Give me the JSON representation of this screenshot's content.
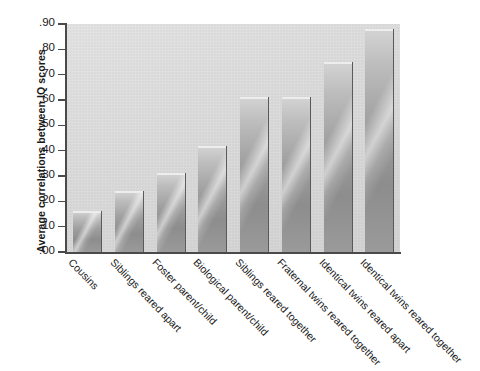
{
  "chart_data": {
    "type": "bar",
    "title": "",
    "xlabel": "",
    "ylabel": "Average correlations between IQ scores",
    "ylim": [
      0.0,
      0.9
    ],
    "grid": false,
    "legend": "none",
    "ytick_labels": [
      ".90",
      ".80",
      ".70",
      ".60",
      ".50",
      ".40",
      ".30",
      ".20",
      ".10",
      ".00"
    ],
    "ytick_values": [
      0.9,
      0.8,
      0.7,
      0.6,
      0.5,
      0.4,
      0.3,
      0.2,
      0.1,
      0.0
    ],
    "categories": [
      "Cousins",
      "Siblings reared apart",
      "Foster parent/child",
      "Biological parent/child",
      "Siblings reared together",
      "Fraternal twins reared together",
      "Identical twins reared apart",
      "Identical twins reared together"
    ],
    "values": [
      0.16,
      0.24,
      0.31,
      0.42,
      0.61,
      0.61,
      0.75,
      0.88
    ],
    "bar_color": "#9e9e9e",
    "plot_background": "#dcdcdc",
    "axis_color": "#4a4a4a",
    "page_background": "#ffffff"
  }
}
